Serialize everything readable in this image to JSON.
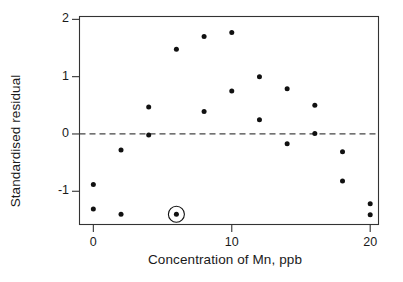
{
  "chart_data": {
    "type": "scatter",
    "title": "",
    "xlabel": "Concentration of Mn, ppb",
    "ylabel": "Standardised residual",
    "xlim": [
      -1.0,
      20.6
    ],
    "ylim": [
      -1.58,
      2.05
    ],
    "xticks": [
      0,
      10,
      20
    ],
    "xtick_labels": [
      "0",
      "10",
      "20"
    ],
    "yticks": [
      -1,
      0,
      1,
      2
    ],
    "ytick_labels": [
      "-1",
      "0",
      "1",
      "2"
    ],
    "grid": false,
    "legend": null,
    "reference_lines": [
      {
        "name": "zero-line",
        "orientation": "horizontal",
        "value": 0,
        "style": "dashed",
        "color": "#444444"
      }
    ],
    "marker": {
      "shape": "circle",
      "color": "#111111",
      "size_px": 5
    },
    "x": [
      0,
      0,
      2,
      2,
      4,
      4,
      6,
      6,
      8,
      8,
      10,
      10,
      12,
      12,
      14,
      14,
      16,
      16,
      18,
      18,
      20,
      20
    ],
    "y": [
      -0.88,
      -1.31,
      -0.28,
      -1.4,
      0.47,
      -0.02,
      1.48,
      -1.4,
      1.7,
      0.39,
      1.77,
      0.75,
      1.0,
      0.25,
      0.79,
      -0.17,
      0.5,
      0.01,
      -0.31,
      -0.82,
      -1.22,
      -1.41
    ],
    "points": [
      {
        "x": 0,
        "y": -0.88,
        "highlighted": false
      },
      {
        "x": 0,
        "y": -1.31,
        "highlighted": false
      },
      {
        "x": 2,
        "y": -0.28,
        "highlighted": false
      },
      {
        "x": 2,
        "y": -1.4,
        "highlighted": false
      },
      {
        "x": 4,
        "y": 0.47,
        "highlighted": false
      },
      {
        "x": 4,
        "y": -0.02,
        "highlighted": false
      },
      {
        "x": 6,
        "y": 1.48,
        "highlighted": false
      },
      {
        "x": 6,
        "y": -1.4,
        "highlighted": true
      },
      {
        "x": 8,
        "y": 1.7,
        "highlighted": false
      },
      {
        "x": 8,
        "y": 0.39,
        "highlighted": false
      },
      {
        "x": 10,
        "y": 1.77,
        "highlighted": false
      },
      {
        "x": 10,
        "y": 0.75,
        "highlighted": false
      },
      {
        "x": 12,
        "y": 1.0,
        "highlighted": false
      },
      {
        "x": 12,
        "y": 0.25,
        "highlighted": false
      },
      {
        "x": 14,
        "y": 0.79,
        "highlighted": false
      },
      {
        "x": 14,
        "y": -0.17,
        "highlighted": false
      },
      {
        "x": 16,
        "y": 0.5,
        "highlighted": false
      },
      {
        "x": 16,
        "y": 0.01,
        "highlighted": false
      },
      {
        "x": 18,
        "y": -0.31,
        "highlighted": false
      },
      {
        "x": 18,
        "y": -0.82,
        "highlighted": false
      },
      {
        "x": 20,
        "y": -1.22,
        "highlighted": false
      },
      {
        "x": 20,
        "y": -1.41,
        "highlighted": false
      }
    ],
    "annotations": [
      {
        "name": "outlier-ring",
        "type": "circle-marker",
        "x": 6,
        "y": -1.4,
        "radius_px": 8,
        "color": "#111111"
      }
    ],
    "colors": {
      "axis": "#333333",
      "marker": "#111111",
      "reference_line": "#444444",
      "background": "#ffffff"
    }
  }
}
